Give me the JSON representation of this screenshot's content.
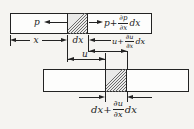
{
  "figure": {
    "name": "pressure-displacement-element-diagram",
    "colors": {
      "background": "#f5f4f1",
      "line": "#232323",
      "bar_fill": "#fdfdfc",
      "hatch": "#6b6b6b"
    },
    "top_bar": {
      "pressure_left_label": "p",
      "pressure_right": {
        "prefix": "p+",
        "numerator": "∂p",
        "denominator": "∂x",
        "suffix": "dx"
      }
    },
    "dimensions": {
      "x_label": "x",
      "dx_label": "dx",
      "u_label": "u",
      "u_displaced": {
        "prefix": "u+",
        "numerator": "∂u",
        "denominator": "∂x",
        "suffix": "dx"
      },
      "dx_displaced": {
        "prefix": "dx+",
        "numerator": "∂u",
        "denominator": "∂x",
        "suffix": "dx"
      }
    }
  }
}
